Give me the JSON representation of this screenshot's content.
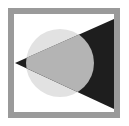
{
  "logo": {
    "name": "circle-triangle-logo",
    "colors": {
      "background": "#ffffff",
      "frame": "#9a9a9a",
      "circle": "#e2e2e2",
      "overlap": "#b4b4b4",
      "triangle": "#1e1e1e"
    }
  }
}
